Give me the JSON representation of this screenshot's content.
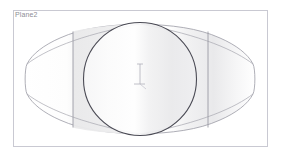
{
  "viewport": {
    "width": 282,
    "height": 160,
    "background_color": "#ffffff"
  },
  "plane": {
    "label": "Plane2",
    "label_color": "#8d8d95",
    "border_color": "#c9c9d2",
    "fill_color": "#ffffff",
    "rect": {
      "x": 13,
      "y": 10,
      "width": 255,
      "height": 137
    }
  },
  "geometry": {
    "loft_profile": {
      "name": "lens-profile",
      "outline_color": "#9a9aa4",
      "fill_color": "#ffffff",
      "left_tip_x": 26,
      "right_tip_x": 255,
      "top_y": 24,
      "bottom_y": 134,
      "center_y": 79
    },
    "circle": {
      "name": "projected-circle",
      "outline_color": "#4b4b55",
      "center_x": 140,
      "center_y": 79,
      "radius": 57
    },
    "section_line_left": {
      "name": "section-line-left",
      "x": 73,
      "y_top": 31,
      "y_bottom": 128,
      "color": "#9a9aa4"
    },
    "section_line_right": {
      "name": "section-line-right",
      "x": 208,
      "y_top": 31,
      "y_bottom": 128,
      "color": "#9a9aa4"
    },
    "shading": {
      "band_light": "#ececed",
      "band_mid": "#f6f6f7",
      "band_white": "#ffffff",
      "band_gray": "#e6e6e8"
    }
  },
  "origin_marker": {
    "name": "origin-axes",
    "x": 140,
    "y": 79,
    "color": "#b0b0ba",
    "vertical_length": 18,
    "horizontal_length": 11
  }
}
